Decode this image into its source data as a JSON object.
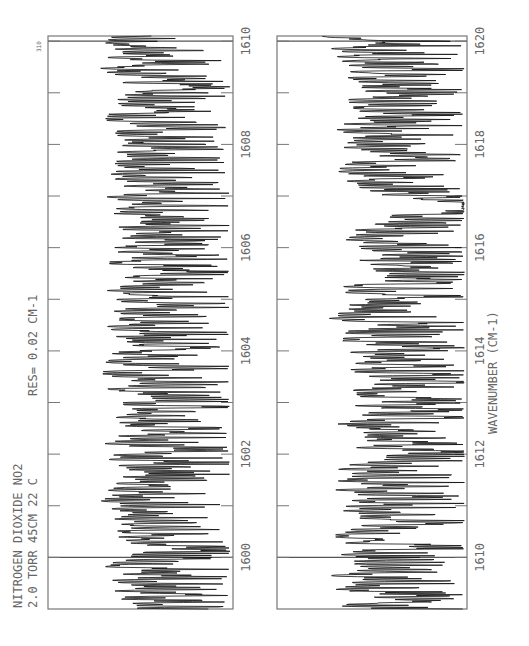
{
  "chart_data": {
    "type": "line",
    "orientation": "rotated-90",
    "title": "NITROGEN DIOXIDE  NO2",
    "subtitle": "2.0 TORR  45CM  22 C",
    "annotation": "RES= 0.02 CM-1",
    "page_number": "310",
    "xlabel": "WAVENUMBER (CM-1)",
    "ylabel": "Transmittance",
    "grid": false,
    "panels": [
      {
        "name": "upper-range",
        "xlim": [
          1599.0,
          1610.1
        ],
        "tick_labels": [
          "1600",
          "1602",
          "1604",
          "1606",
          "1608",
          "1610"
        ],
        "major_ticks": [
          1600,
          1601,
          1602,
          1603,
          1604,
          1605,
          1606,
          1607,
          1608,
          1609,
          1610
        ],
        "reference_lines": [
          1600,
          1610
        ],
        "series": [
          {
            "name": "NO2 transmittance",
            "description": "dense rotational line structure, ~30-40 absorption lines per cm-1, depths 20-95%"
          }
        ]
      },
      {
        "name": "lower-range",
        "xlim": [
          1609.0,
          1620.1
        ],
        "tick_labels": [
          "1610",
          "1612",
          "1614",
          "1616",
          "1618",
          "1620"
        ],
        "major_ticks": [
          1610,
          1611,
          1612,
          1613,
          1614,
          1615,
          1616,
          1617,
          1618,
          1619,
          1620
        ],
        "reference_lines": [
          1610,
          1620
        ],
        "series": [
          {
            "name": "NO2 transmittance",
            "description": "dense rotational lines; broad absorption feature near 1616.8 cm-1"
          }
        ]
      }
    ]
  },
  "labels": {
    "title": "NITROGEN DIOXIDE  NO2",
    "conditions": "2.0 TORR  45CM  22 C",
    "resolution": "RES= 0.02 CM-1",
    "page": "310",
    "axis_title": "WAVENUMBER (CM-1)"
  },
  "colors": {
    "trace": "#111111",
    "frame": "#777777",
    "text": "#666666",
    "background": "#ffffff"
  }
}
